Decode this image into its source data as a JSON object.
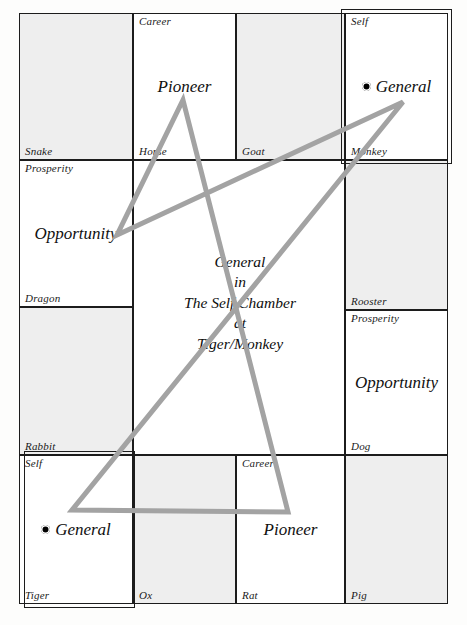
{
  "chart": {
    "center_summary": {
      "line1": "General",
      "line2": "in",
      "line3": "The Self Chamber",
      "line4": "at",
      "line5": "Tiger/Monkey"
    },
    "colors": {
      "grid_line": "#1c1c1c",
      "cell_shaded": "#eeeeee",
      "cell_plain": "#ffffff",
      "star_line": "#a0a0a0",
      "text": "#111111",
      "marker_dot": "#000000"
    },
    "cells": [
      {
        "branch": "Snake",
        "aspiration": "",
        "star": "",
        "marker": false,
        "shaded": true,
        "highlighted": false,
        "x": 19,
        "y": 13,
        "w": 114,
        "h": 147
      },
      {
        "branch": "Horse",
        "aspiration": "Career",
        "star": "Pioneer",
        "marker": false,
        "shaded": false,
        "highlighted": false,
        "x": 133,
        "y": 13,
        "w": 103,
        "h": 147
      },
      {
        "branch": "Goat",
        "aspiration": "",
        "star": "",
        "marker": false,
        "shaded": true,
        "highlighted": false,
        "x": 236,
        "y": 13,
        "w": 109,
        "h": 147
      },
      {
        "branch": "Monkey",
        "aspiration": "Self",
        "star": "General",
        "marker": true,
        "shaded": false,
        "highlighted": true,
        "x": 345,
        "y": 13,
        "w": 103,
        "h": 147
      },
      {
        "branch": "Dragon",
        "aspiration": "Prosperity",
        "star": "Opportunity",
        "marker": false,
        "shaded": false,
        "highlighted": false,
        "x": 19,
        "y": 160,
        "w": 114,
        "h": 147
      },
      {
        "branch": "Rooster",
        "aspiration": "",
        "star": "",
        "marker": false,
        "shaded": true,
        "highlighted": false,
        "x": 345,
        "y": 160,
        "w": 103,
        "h": 150
      },
      {
        "branch": "Rabbit",
        "aspiration": "",
        "star": "",
        "marker": false,
        "shaded": true,
        "highlighted": false,
        "x": 19,
        "y": 307,
        "w": 114,
        "h": 148
      },
      {
        "branch": "Dog",
        "aspiration": "Prosperity",
        "star": "Opportunity",
        "marker": false,
        "shaded": false,
        "highlighted": false,
        "x": 345,
        "y": 310,
        "w": 103,
        "h": 145
      },
      {
        "branch": "Tiger",
        "aspiration": "Self",
        "star": "General",
        "marker": true,
        "shaded": false,
        "highlighted": true,
        "x": 19,
        "y": 455,
        "w": 114,
        "h": 149
      },
      {
        "branch": "Ox",
        "aspiration": "",
        "star": "",
        "marker": false,
        "shaded": true,
        "highlighted": false,
        "x": 133,
        "y": 455,
        "w": 103,
        "h": 149
      },
      {
        "branch": "Rat",
        "aspiration": "Career",
        "star": "Pioneer",
        "marker": false,
        "shaded": false,
        "highlighted": false,
        "x": 236,
        "y": 455,
        "w": 109,
        "h": 149
      },
      {
        "branch": "Pig",
        "aspiration": "",
        "star": "",
        "marker": false,
        "shaded": true,
        "highlighted": false,
        "x": 345,
        "y": 455,
        "w": 103,
        "h": 149
      }
    ],
    "highlight_boxes": [
      {
        "name": "monkey-self-highlight",
        "x": 341,
        "y": 9,
        "w": 111,
        "h": 155
      },
      {
        "name": "tiger-self-highlight",
        "x": 24,
        "y": 451,
        "w": 111,
        "h": 157
      }
    ],
    "star_polygon": {
      "name": "five-pointed-star",
      "stroke": "#a3a3a3",
      "stroke_width": 5,
      "points": "183,100 288,512 72,510 403,102 117,235"
    },
    "center_panel": {
      "x": 133,
      "y": 160,
      "w": 212,
      "h": 295
    }
  }
}
